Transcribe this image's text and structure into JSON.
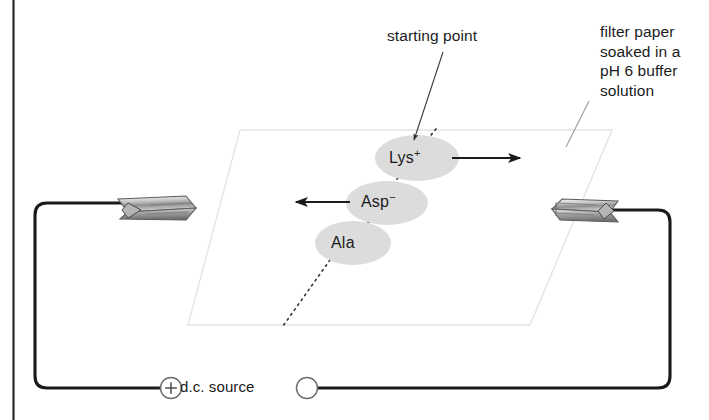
{
  "figure": {
    "type": "diagram"
  },
  "annotations": {
    "starting_point": "starting point",
    "filter_paper": "filter paper\nsoaked in a\npH 6 buffer\nsolution"
  },
  "power_supply": {
    "label": "d.c. source",
    "positive_terminal": "+",
    "negative_terminal": ""
  },
  "spots": [
    {
      "id": "lys",
      "name": "Lys",
      "charge": "+",
      "migration": "right",
      "migration_direction_label": "toward negative electrode",
      "cx": 417,
      "cy": 158,
      "rx": 42,
      "ry": 23
    },
    {
      "id": "asp",
      "name": "Asp",
      "charge": "−",
      "migration": "left",
      "migration_direction_label": "toward positive electrode",
      "cx": 387,
      "cy": 203,
      "rx": 41,
      "ry": 22
    },
    {
      "id": "ala",
      "name": "Ala",
      "charge": "",
      "migration": "none",
      "migration_direction_label": "no net migration",
      "cx": 353,
      "cy": 243,
      "rx": 38,
      "ry": 22
    }
  ],
  "colors": {
    "spot_fill": "#dcdcdc",
    "paper_edge": "#e2e2e2",
    "wire": "#1a1a1a",
    "ink": "#1b1b1b",
    "clip_light": "#f2f2f2",
    "clip_mid": "#9a9a9a",
    "clip_dark": "#4a4a4a",
    "leader_gray": "#9b9b9b",
    "frame_border": "#2a2a2a"
  },
  "geometry": {
    "paper_corners": "240,130 612,130 530,325 188,325",
    "wire_path": "M 160 388 L 47 388 Q 35 388 35 376 L 35 215 Q 35 203 47 203 L 170 203",
    "wire_path_right": "M 555 210 L 658 210 Q 670 210 670 222 L 670 376 Q 670 388 658 388 L 318 388"
  }
}
